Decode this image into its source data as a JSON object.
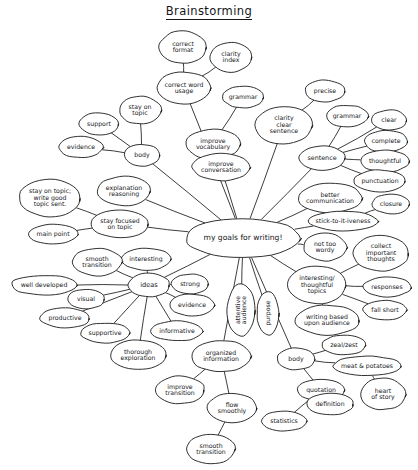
{
  "title": "Brainstorming",
  "style": {
    "ink": "#1a1a1a",
    "paper": "#ffffff"
  },
  "center": {
    "id": "center",
    "label": "my goals for writing!",
    "cx": 243,
    "cy": 238,
    "rx": 58,
    "ry": 20,
    "fs": 7.6
  },
  "nodes": [
    {
      "id": "correct-format",
      "label": "correct\nformat",
      "cx": 183,
      "cy": 47,
      "rx": 24,
      "ry": 16,
      "fs": 6.2
    },
    {
      "id": "clarity-index",
      "label": "clarity\nindex",
      "cx": 231,
      "cy": 57,
      "rx": 21,
      "ry": 15,
      "fs": 6.2
    },
    {
      "id": "correct-word-usage",
      "label": "correct word\nusage",
      "cx": 184,
      "cy": 88,
      "rx": 27,
      "ry": 16,
      "fs": 6.2
    },
    {
      "id": "grammar-top",
      "label": "grammar",
      "cx": 243,
      "cy": 97,
      "rx": 21,
      "ry": 11,
      "fs": 6.2
    },
    {
      "id": "precise",
      "label": "precise",
      "cx": 325,
      "cy": 91,
      "rx": 20,
      "ry": 11,
      "fs": 6.2
    },
    {
      "id": "stay-on-topic",
      "label": "stay on\ntopic",
      "cx": 140,
      "cy": 110,
      "rx": 21,
      "ry": 14,
      "fs": 6.2
    },
    {
      "id": "support",
      "label": "support",
      "cx": 99,
      "cy": 124,
      "rx": 20,
      "ry": 11,
      "fs": 6.2
    },
    {
      "id": "clarity-clear-sentence",
      "label": "clarity\nclear\nsentence",
      "cx": 284,
      "cy": 125,
      "rx": 29,
      "ry": 19,
      "fs": 6.2
    },
    {
      "id": "grammar-right",
      "label": "grammar",
      "cx": 347,
      "cy": 116,
      "rx": 21,
      "ry": 11,
      "fs": 6.2
    },
    {
      "id": "clear",
      "label": "clear",
      "cx": 389,
      "cy": 120,
      "rx": 18,
      "ry": 10,
      "fs": 6.2
    },
    {
      "id": "improve-vocabulary",
      "label": "improve\nvocabulary",
      "cx": 213,
      "cy": 144,
      "rx": 28,
      "ry": 15,
      "fs": 6.2
    },
    {
      "id": "evidence-left",
      "label": "evidence",
      "cx": 81,
      "cy": 147,
      "rx": 22,
      "ry": 11,
      "fs": 6.2
    },
    {
      "id": "complete",
      "label": "complete",
      "cx": 386,
      "cy": 141,
      "rx": 22,
      "ry": 11,
      "fs": 6.2
    },
    {
      "id": "body-top",
      "label": "body",
      "cx": 142,
      "cy": 155,
      "rx": 18,
      "ry": 11,
      "fs": 6.2
    },
    {
      "id": "sentence",
      "label": "sentence",
      "cx": 322,
      "cy": 158,
      "rx": 24,
      "ry": 12,
      "fs": 6.4
    },
    {
      "id": "thoughtful",
      "label": "thoughtful",
      "cx": 385,
      "cy": 161,
      "rx": 25,
      "ry": 11,
      "fs": 6.2
    },
    {
      "id": "improve-conversation",
      "label": "improve\nconversation",
      "cx": 221,
      "cy": 167,
      "rx": 29,
      "ry": 14,
      "fs": 6.2
    },
    {
      "id": "punctuation",
      "label": "punctuation",
      "cx": 380,
      "cy": 181,
      "rx": 26,
      "ry": 11,
      "fs": 6.2
    },
    {
      "id": "explanation-reasoning",
      "label": "explanation\nreasoning",
      "cx": 124,
      "cy": 191,
      "rx": 27,
      "ry": 15,
      "fs": 6.2
    },
    {
      "id": "better-communication",
      "label": "better\ncommunication",
      "cx": 330,
      "cy": 198,
      "rx": 32,
      "ry": 15,
      "fs": 6.2
    },
    {
      "id": "stay-on-topic-write",
      "label": "stay on topic;\nwrite good\ntopic sent.",
      "cx": 50,
      "cy": 198,
      "rx": 31,
      "ry": 19,
      "fs": 6.2
    },
    {
      "id": "closure",
      "label": "closure",
      "cx": 391,
      "cy": 204,
      "rx": 19,
      "ry": 10,
      "fs": 6.2
    },
    {
      "id": "stick-to-it-iveness",
      "label": "stick-to-it-iveness",
      "cx": 343,
      "cy": 221,
      "rx": 35,
      "ry": 10,
      "fs": 6.2
    },
    {
      "id": "stay-focused-on-topic",
      "label": "stay focused\non topic",
      "cx": 120,
      "cy": 224,
      "rx": 29,
      "ry": 14,
      "fs": 6.2
    },
    {
      "id": "main-point",
      "label": "main point",
      "cx": 53,
      "cy": 234,
      "rx": 25,
      "ry": 10,
      "fs": 6.2
    },
    {
      "id": "not-too-wordy",
      "label": "not too\nwordy",
      "cx": 325,
      "cy": 247,
      "rx": 22,
      "ry": 14,
      "fs": 6.2
    },
    {
      "id": "collect-important",
      "label": "collect\nimportant\nthoughts",
      "cx": 381,
      "cy": 253,
      "rx": 28,
      "ry": 18,
      "fs": 6.2
    },
    {
      "id": "interesting",
      "label": "interesting",
      "cx": 146,
      "cy": 259,
      "rx": 25,
      "ry": 11,
      "fs": 6.2
    },
    {
      "id": "smooth-transition-top",
      "label": "smooth\ntransition",
      "cx": 97,
      "cy": 262,
      "rx": 25,
      "ry": 14,
      "fs": 6.2
    },
    {
      "id": "interesting-topics",
      "label": "interesting/\nthoughtful\ntopics",
      "cx": 317,
      "cy": 285,
      "rx": 30,
      "ry": 19,
      "fs": 6.2
    },
    {
      "id": "well-developed",
      "label": "well developed",
      "cx": 44,
      "cy": 285,
      "rx": 33,
      "ry": 10,
      "fs": 6.2
    },
    {
      "id": "ideas",
      "label": "ideas",
      "cx": 149,
      "cy": 285,
      "rx": 21,
      "ry": 12,
      "fs": 6.6
    },
    {
      "id": "strong",
      "label": "strong",
      "cx": 190,
      "cy": 284,
      "rx": 19,
      "ry": 10,
      "fs": 6.2
    },
    {
      "id": "responses",
      "label": "responses",
      "cx": 387,
      "cy": 287,
      "rx": 24,
      "ry": 10,
      "fs": 6.2
    },
    {
      "id": "visual",
      "label": "visual",
      "cx": 86,
      "cy": 299,
      "rx": 19,
      "ry": 10,
      "fs": 6.2
    },
    {
      "id": "evidence-ideas",
      "label": "evidence",
      "cx": 192,
      "cy": 305,
      "rx": 23,
      "ry": 11,
      "fs": 6.2
    },
    {
      "id": "fall-short",
      "label": "fall short",
      "cx": 385,
      "cy": 310,
      "rx": 22,
      "ry": 10,
      "fs": 6.2
    },
    {
      "id": "productive",
      "label": "productive",
      "cx": 65,
      "cy": 318,
      "rx": 25,
      "ry": 10,
      "fs": 6.2
    },
    {
      "id": "attentive-audience",
      "label": "attentive\naudience",
      "cx": 241,
      "cy": 310,
      "rx": 14,
      "ry": 26,
      "fs": 6.2,
      "rotate": -90
    },
    {
      "id": "purpose",
      "label": "purpose",
      "cx": 268,
      "cy": 313,
      "rx": 11,
      "ry": 22,
      "fs": 6.2,
      "rotate": -90
    },
    {
      "id": "writing-based",
      "label": "writing based\nupon audience",
      "cx": 327,
      "cy": 320,
      "rx": 33,
      "ry": 15,
      "fs": 6.2
    },
    {
      "id": "supportive",
      "label": "supportive",
      "cx": 105,
      "cy": 333,
      "rx": 25,
      "ry": 10,
      "fs": 6.2
    },
    {
      "id": "informative",
      "label": "informative",
      "cx": 177,
      "cy": 331,
      "rx": 26,
      "ry": 10,
      "fs": 6.2
    },
    {
      "id": "zeal-zest",
      "label": "zeal/zest",
      "cx": 344,
      "cy": 345,
      "rx": 22,
      "ry": 10,
      "fs": 6.2
    },
    {
      "id": "thorough-exploration",
      "label": "thorough\nexploration",
      "cx": 138,
      "cy": 355,
      "rx": 28,
      "ry": 15,
      "fs": 6.2
    },
    {
      "id": "organized-information",
      "label": "organized\ninformation",
      "cx": 221,
      "cy": 356,
      "rx": 30,
      "ry": 16,
      "fs": 6.2
    },
    {
      "id": "body-bottom",
      "label": "body",
      "cx": 296,
      "cy": 359,
      "rx": 19,
      "ry": 11,
      "fs": 6.2
    },
    {
      "id": "meat-potatoes",
      "label": "meat & potatoes",
      "cx": 367,
      "cy": 366,
      "rx": 34,
      "ry": 10,
      "fs": 6.2
    },
    {
      "id": "improve-transition",
      "label": "improve\ntransition",
      "cx": 180,
      "cy": 390,
      "rx": 25,
      "ry": 14,
      "fs": 6.2
    },
    {
      "id": "quotation",
      "label": "quotation",
      "cx": 321,
      "cy": 390,
      "rx": 24,
      "ry": 11,
      "fs": 6.2
    },
    {
      "id": "heart-of-story",
      "label": "heart\nof story",
      "cx": 383,
      "cy": 394,
      "rx": 23,
      "ry": 16,
      "fs": 6.2
    },
    {
      "id": "definition",
      "label": "definition",
      "cx": 330,
      "cy": 404,
      "rx": 24,
      "ry": 11,
      "fs": 6.2
    },
    {
      "id": "flow-smoothly",
      "label": "flow\nsmoothly",
      "cx": 232,
      "cy": 408,
      "rx": 25,
      "ry": 15,
      "fs": 6.2
    },
    {
      "id": "statistics",
      "label": "statistics",
      "cx": 284,
      "cy": 421,
      "rx": 23,
      "ry": 10,
      "fs": 6.2
    },
    {
      "id": "smooth-transition-bot",
      "label": "smooth\ntransition",
      "cx": 211,
      "cy": 449,
      "rx": 25,
      "ry": 15,
      "fs": 6.2
    }
  ],
  "edges": [
    [
      "correct-format",
      "correct-word-usage"
    ],
    [
      "clarity-index",
      "correct-word-usage"
    ],
    [
      "correct-word-usage",
      "center"
    ],
    [
      "grammar-top",
      "improve-vocabulary"
    ],
    [
      "improve-vocabulary",
      "center"
    ],
    [
      "stay-on-topic",
      "body-top"
    ],
    [
      "support",
      "body-top"
    ],
    [
      "evidence-left",
      "body-top"
    ],
    [
      "body-top",
      "center"
    ],
    [
      "precise",
      "clarity-clear-sentence"
    ],
    [
      "clarity-clear-sentence",
      "center"
    ],
    [
      "grammar-right",
      "sentence"
    ],
    [
      "clear",
      "sentence"
    ],
    [
      "complete",
      "sentence"
    ],
    [
      "thoughtful",
      "sentence"
    ],
    [
      "punctuation",
      "sentence"
    ],
    [
      "sentence",
      "center"
    ],
    [
      "better-communication",
      "center"
    ],
    [
      "closure",
      "stick-to-it-iveness"
    ],
    [
      "stick-to-it-iveness",
      "center"
    ],
    [
      "explanation-reasoning",
      "center"
    ],
    [
      "stay-on-topic-write",
      "stay-focused-on-topic"
    ],
    [
      "main-point",
      "stay-focused-on-topic"
    ],
    [
      "stay-focused-on-topic",
      "center"
    ],
    [
      "not-too-wordy",
      "center"
    ],
    [
      "collect-important",
      "interesting-topics"
    ],
    [
      "responses",
      "interesting-topics"
    ],
    [
      "fall-short",
      "interesting-topics"
    ],
    [
      "interesting-topics",
      "center"
    ],
    [
      "writing-based",
      "interesting-topics"
    ],
    [
      "interesting",
      "ideas"
    ],
    [
      "smooth-transition-top",
      "ideas"
    ],
    [
      "well-developed",
      "ideas"
    ],
    [
      "strong",
      "ideas"
    ],
    [
      "visual",
      "ideas"
    ],
    [
      "evidence-ideas",
      "ideas"
    ],
    [
      "productive",
      "ideas"
    ],
    [
      "supportive",
      "ideas"
    ],
    [
      "informative",
      "ideas"
    ],
    [
      "thorough-exploration",
      "ideas"
    ],
    [
      "ideas",
      "center"
    ],
    [
      "attentive-audience",
      "center"
    ],
    [
      "purpose",
      "center"
    ],
    [
      "organized-information",
      "center"
    ],
    [
      "body-bottom",
      "center"
    ],
    [
      "zeal-zest",
      "body-bottom"
    ],
    [
      "meat-potatoes",
      "body-bottom"
    ],
    [
      "quotation",
      "body-bottom"
    ],
    [
      "heart-of-story",
      "meat-potatoes"
    ],
    [
      "definition",
      "quotation"
    ],
    [
      "statistics",
      "quotation"
    ],
    [
      "improve-transition",
      "organized-information"
    ],
    [
      "flow-smoothly",
      "organized-information"
    ],
    [
      "smooth-transition-bot",
      "flow-smoothly"
    ]
  ]
}
